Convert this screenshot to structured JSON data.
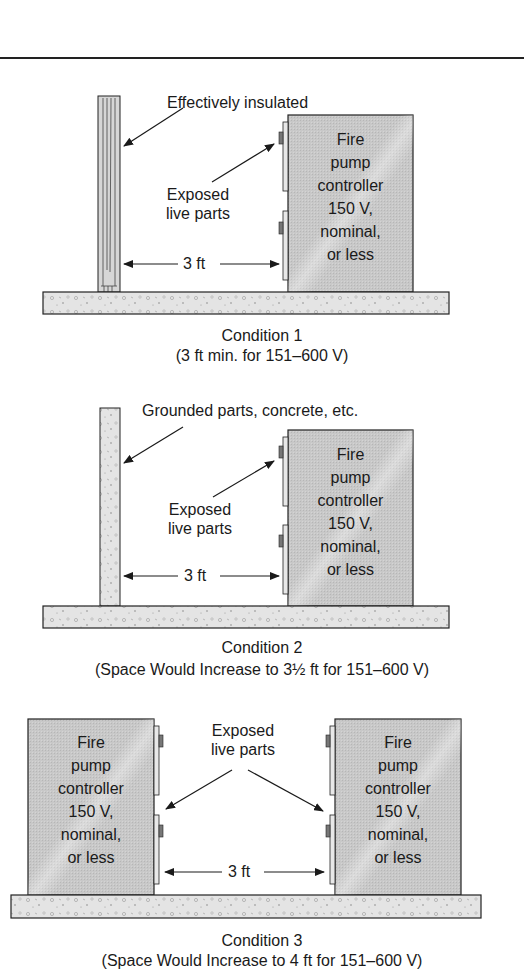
{
  "figure": {
    "top_rule": true,
    "colors": {
      "controller_fill": "#c9c9c9",
      "slab_fill": "#e2e2e2",
      "outline": "#222222",
      "text": "#1a1a1a",
      "background": "#ffffff"
    }
  },
  "conditions": [
    {
      "id": "condition-1",
      "wall_type": "insulated",
      "wall_label": "Effectively insulated",
      "live_parts_label_line1": "Exposed",
      "live_parts_label_line2": "live parts",
      "distance": "3 ft",
      "controller": {
        "line1": "Fire",
        "line2": "pump",
        "line3": "controller",
        "line4": "150 V,",
        "line5": "nominal,",
        "line6": "or less"
      },
      "caption_title": "Condition 1",
      "caption_note": "(3 ft min. for 151–600 V)"
    },
    {
      "id": "condition-2",
      "wall_type": "grounded",
      "wall_label": "Grounded parts, concrete, etc.",
      "live_parts_label_line1": "Exposed",
      "live_parts_label_line2": "live parts",
      "distance": "3 ft",
      "controller": {
        "line1": "Fire",
        "line2": "pump",
        "line3": "controller",
        "line4": "150 V,",
        "line5": "nominal,",
        "line6": "or less"
      },
      "caption_title": "Condition 2",
      "caption_note": "(Space Would Increase to 3½ ft for 151–600 V)"
    },
    {
      "id": "condition-3",
      "wall_type": "none",
      "live_parts_label_line1": "Exposed",
      "live_parts_label_line2": "live parts",
      "distance": "3 ft",
      "controller_left": {
        "line1": "Fire",
        "line2": "pump",
        "line3": "controller",
        "line4": "150 V,",
        "line5": "nominal,",
        "line6": "or less"
      },
      "controller_right": {
        "line1": "Fire",
        "line2": "pump",
        "line3": "controller",
        "line4": "150 V,",
        "line5": "nominal,",
        "line6": "or less"
      },
      "caption_title": "Condition 3",
      "caption_note": "(Space Would Increase to 4 ft for 151–600 V)"
    }
  ]
}
